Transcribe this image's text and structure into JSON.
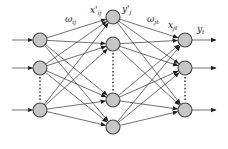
{
  "diagram": {
    "type": "neural-network",
    "colors": {
      "node_fill": "#c6c6c6",
      "node_stroke": "#444444",
      "edge": "#333333",
      "background": "#ffffff"
    },
    "layers": [
      {
        "name": "input",
        "x": 40,
        "nodes_y": [
          40,
          68,
          110
        ],
        "ellipsis_between": [
          1,
          2
        ]
      },
      {
        "name": "hidden",
        "x": 113,
        "nodes_y": [
          17,
          44,
          100,
          127
        ],
        "ellipsis_between": [
          1,
          2
        ]
      },
      {
        "name": "output",
        "x": 185,
        "nodes_y": [
          40,
          68,
          110
        ],
        "ellipsis_between": [
          1,
          2
        ]
      }
    ],
    "labels": {
      "w_ij": {
        "base": "ω",
        "sub": "ij"
      },
      "x_prime_ij": {
        "base": "x'",
        "sub": "ij"
      },
      "y_prime_j": {
        "base": "y'",
        "sub": "j"
      },
      "w_jt": {
        "base": "ω",
        "sub": "jt"
      },
      "x_jt": {
        "base": "x",
        "sub": "jt"
      },
      "y_t": {
        "base": "y",
        "sub": "t"
      }
    }
  }
}
